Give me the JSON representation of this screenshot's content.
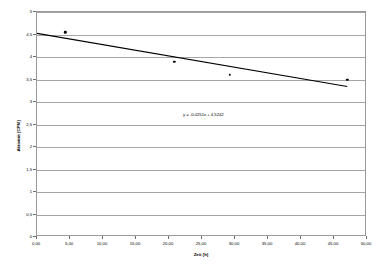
{
  "chart_data": {
    "type": "scatter",
    "title": "",
    "xlabel": "Zeit [h]",
    "ylabel": "Aktivität [CPM]",
    "xlim": [
      0,
      50
    ],
    "ylim": [
      0,
      5
    ],
    "grid": true,
    "legend": "none",
    "x_tick_labels": [
      "0,00",
      "5,00",
      "10,00",
      "15,00",
      "20,00",
      "25,00",
      "30,00",
      "35,00",
      "40,00",
      "45,00",
      "50,00"
    ],
    "x_tick_values": [
      0,
      5,
      10,
      15,
      20,
      25,
      30,
      35,
      40,
      45,
      50
    ],
    "y_tick_labels": [
      "0",
      "0,5",
      "1",
      "1,5",
      "2",
      "2,5",
      "3",
      "3,5",
      "4",
      "4,5",
      "5"
    ],
    "y_tick_values": [
      0,
      0.5,
      1,
      1.5,
      2,
      2.5,
      3,
      3.5,
      4,
      4.5,
      5
    ],
    "series": [
      {
        "name": "Aktivität",
        "points": [
          {
            "x": 4.3,
            "y": 4.55
          },
          {
            "x": 20.8,
            "y": 3.9
          },
          {
            "x": 29.2,
            "y": 3.6
          },
          {
            "x": 47.0,
            "y": 3.5
          }
        ]
      }
    ],
    "trendline": {
      "type": "linear",
      "slope": -0.0251,
      "intercept": 4.5242,
      "x_start": 0,
      "x_end": 47.0,
      "equation": "y = -0,0251x + 4,5242",
      "equation_x": 25.2,
      "equation_y": 2.71
    }
  }
}
